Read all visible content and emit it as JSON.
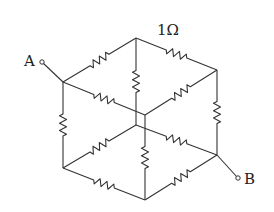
{
  "diagram": {
    "type": "resistor-cube-circuit",
    "resistance_label": "1Ω",
    "terminal_a": "A",
    "terminal_b": "B",
    "nodes": {
      "A": [
        63,
        82
      ],
      "T": [
        136,
        38
      ],
      "R": [
        217,
        70
      ],
      "F": [
        145,
        115
      ],
      "BL": [
        63,
        168
      ],
      "BB": [
        136,
        125
      ],
      "B": [
        217,
        155
      ],
      "BC": [
        145,
        200
      ]
    },
    "edges": [
      [
        "A",
        "T"
      ],
      [
        "T",
        "R"
      ],
      [
        "A",
        "F"
      ],
      [
        "R",
        "F"
      ],
      [
        "T",
        "BB"
      ],
      [
        "A",
        "BL"
      ],
      [
        "R",
        "B"
      ],
      [
        "F",
        "BC"
      ],
      [
        "BL",
        "BB"
      ],
      [
        "BB",
        "B"
      ],
      [
        "BL",
        "BC"
      ],
      [
        "BC",
        "B"
      ]
    ]
  }
}
